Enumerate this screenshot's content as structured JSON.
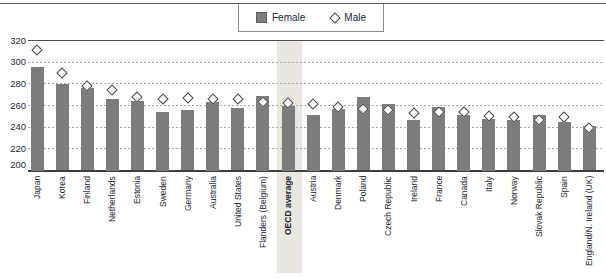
{
  "legend": {
    "items": [
      {
        "label": "Female",
        "swatch": "filled-square"
      },
      {
        "label": "Male",
        "swatch": "open-diamond"
      }
    ]
  },
  "colors": {
    "bar": "#7c7c7c",
    "marker_outline": "#474747",
    "highlight_band": "#e9e7df",
    "gridline": "#a9a9a9",
    "axis_line": "#3f3f3f",
    "text": "#1e2836"
  },
  "chart_data": {
    "type": "bar",
    "title": "",
    "xlabel": "",
    "ylabel": "",
    "ylim": [
      200,
      320
    ],
    "yticks": [
      200,
      220,
      240,
      260,
      280,
      300,
      320
    ],
    "grid": "horizontal-dashed",
    "legend_position": "top-center",
    "highlight_category": "OECD average",
    "categories": [
      "Japan",
      "Korea",
      "Finland",
      "Netherlands",
      "Estonia",
      "Sweden",
      "Germany",
      "Australia",
      "United States",
      "Flanders (Belgium)",
      "OECD average",
      "Austria",
      "Denmark",
      "Poland",
      "Czech Republic",
      "Ireland",
      "France",
      "Canada",
      "Italy",
      "Norway",
      "Slovak Republic",
      "Spain",
      "England/N. Ireland (UK)"
    ],
    "series": [
      {
        "name": "Female",
        "style": "bar",
        "values": [
          296,
          280,
          276,
          266,
          264,
          254,
          256,
          263,
          258,
          269,
          260,
          251,
          257,
          268,
          261,
          247,
          259,
          251,
          248,
          247,
          251,
          245,
          241
        ]
      },
      {
        "name": "Male",
        "style": "open-diamond",
        "values": [
          311,
          290,
          278,
          274,
          268,
          266,
          267,
          266,
          266,
          263,
          262,
          261,
          259,
          257,
          256,
          253,
          254,
          254,
          250,
          249,
          247,
          249,
          239
        ]
      }
    ]
  }
}
